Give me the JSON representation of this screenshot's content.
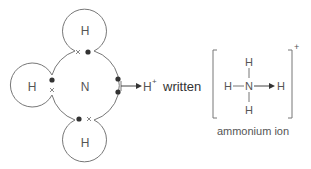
{
  "diagram": {
    "left": {
      "central_atom": "N",
      "hydrogen_atoms": [
        {
          "position": "top",
          "label": "H"
        },
        {
          "position": "left",
          "label": "H"
        },
        {
          "position": "bottom",
          "label": "H"
        }
      ],
      "incoming": {
        "label": "H",
        "charge": "+"
      }
    },
    "connector_word": "written",
    "right": {
      "center": "N",
      "top": "H",
      "left": "H",
      "right": "H",
      "bottom": "H",
      "charge": "+",
      "caption": "ammonium ion"
    }
  }
}
